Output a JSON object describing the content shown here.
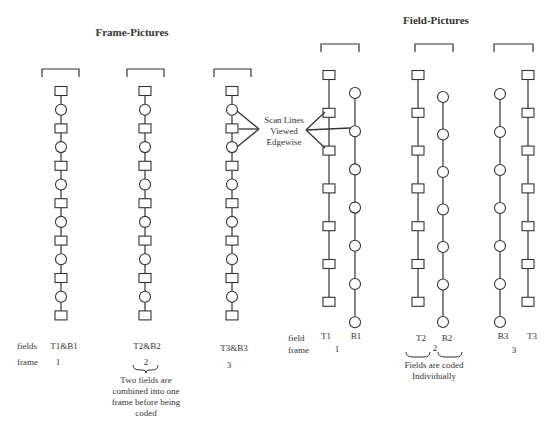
{
  "titles": {
    "frame": "Frame-Pictures",
    "field": "Field-Pictures"
  },
  "callout": {
    "line1": "Scan Lines",
    "line2": "Viewed",
    "line3": "Edgewise"
  },
  "frame_section": {
    "row_labels": {
      "fields": "fields",
      "frame": "frame"
    },
    "columns": [
      {
        "fields": "T1&B1",
        "frame": "1"
      },
      {
        "fields": "T2&B2",
        "frame": "2"
      },
      {
        "fields": "T3&B3",
        "frame": "3"
      }
    ],
    "note": [
      "Two fields are",
      "combined into one",
      "frame before being",
      "coded"
    ]
  },
  "field_section": {
    "row_labels": {
      "field": "field",
      "frame": "frame"
    },
    "groups": [
      {
        "left": "T1",
        "right": "B1",
        "frame": "1"
      },
      {
        "left": "T2",
        "right": "B2",
        "frame": "2"
      },
      {
        "left": "B3",
        "right": "T3",
        "frame": "3"
      }
    ],
    "note": [
      "Fields are  coded",
      "Individually"
    ]
  },
  "structure": {
    "frame_column_nodes": 13,
    "field_column_nodes": 7,
    "node_types": {
      "top_field": "square",
      "bottom_field": "circle"
    }
  }
}
